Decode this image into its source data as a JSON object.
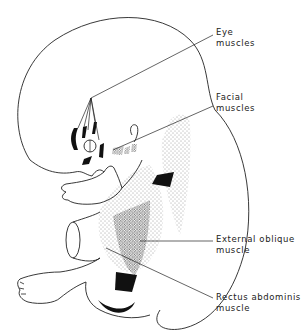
{
  "figure": {
    "labels": [
      {
        "id": "eye",
        "line1": "Eye",
        "line2": "muscles"
      },
      {
        "id": "facial",
        "line1": "Facial",
        "line2": "muscles"
      },
      {
        "id": "external_oblique",
        "line1": "External oblique",
        "line2": "muscle"
      },
      {
        "id": "rectus",
        "line1": "Rectus abdominis",
        "line2": "muscle"
      }
    ],
    "colors": {
      "ink": "#222222",
      "stipple": "#555555",
      "background": "#ffffff"
    }
  }
}
